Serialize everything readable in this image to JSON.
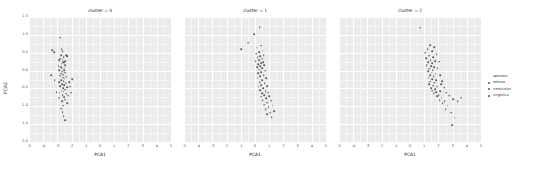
{
  "chart_data": {
    "type": "scatter",
    "title": "",
    "xlabel": "PCA1",
    "ylabel": "PCA2",
    "xlim": [
      -5,
      5
    ],
    "ylim": [
      -2.0,
      1.5
    ],
    "xticks": [
      "-5",
      "-4",
      "-3",
      "-2",
      "-1",
      "0",
      "1",
      "2",
      "3",
      "4",
      "5"
    ],
    "yticks": [
      "1.5",
      "1.0",
      "0.5",
      "0.0",
      "-0.5",
      "-1.0",
      "-1.5",
      "-2.0"
    ],
    "grid": true,
    "facet_by": "cluster",
    "legend": {
      "title": "species",
      "position": "right",
      "entries": [
        "setosa",
        "versicolor",
        "virginica"
      ]
    },
    "facets": [
      {
        "label": "cluster = 0",
        "points": [
          [
            -2.79,
            0.92
          ],
          [
            -2.7,
            0.6
          ],
          [
            -3.22,
            0.51
          ],
          [
            -2.64,
            0.55
          ],
          [
            -2.38,
            0.44
          ],
          [
            -2.72,
            0.44
          ],
          [
            -2.56,
            0.38
          ],
          [
            -2.8,
            0.33
          ],
          [
            -2.64,
            0.31
          ],
          [
            -2.89,
            0.29
          ],
          [
            -2.43,
            0.27
          ],
          [
            -2.6,
            0.24
          ],
          [
            -2.52,
            0.22
          ],
          [
            -2.71,
            0.19
          ],
          [
            -2.47,
            0.16
          ],
          [
            -3.39,
            0.57
          ],
          [
            -2.3,
            0.4
          ],
          [
            -2.91,
            0.13
          ],
          [
            -2.75,
            0.1
          ],
          [
            -2.5,
            0.08
          ],
          [
            -2.63,
            0.05
          ],
          [
            -2.86,
            0.02
          ],
          [
            -2.54,
            0.01
          ],
          [
            -2.68,
            -0.03
          ],
          [
            -2.44,
            -0.06
          ],
          [
            -2.75,
            -0.09
          ],
          [
            -2.58,
            -0.11
          ],
          [
            -2.82,
            -0.14
          ],
          [
            -2.36,
            -0.17
          ],
          [
            -2.61,
            -0.2
          ],
          [
            -2.49,
            -0.23
          ],
          [
            -2.73,
            -0.26
          ],
          [
            -2.55,
            -0.29
          ],
          [
            -2.88,
            -0.32
          ],
          [
            -2.41,
            -0.35
          ],
          [
            -2.66,
            -0.38
          ],
          [
            -2.52,
            -0.41
          ],
          [
            -2.79,
            -0.44
          ],
          [
            -2.33,
            -0.47
          ],
          [
            -2.59,
            -0.5
          ],
          [
            -2.47,
            -0.53
          ],
          [
            -2.7,
            -0.56
          ],
          [
            -2.56,
            -0.59
          ],
          [
            -2.84,
            -0.62
          ],
          [
            -2.39,
            -0.65
          ],
          [
            -2.63,
            -0.69
          ],
          [
            -2.51,
            -0.74
          ],
          [
            -2.45,
            -0.81
          ],
          [
            -2.68,
            -0.86
          ],
          [
            -2.3,
            -0.91
          ],
          [
            -2.59,
            -0.98
          ],
          [
            -2.74,
            -1.07
          ],
          [
            -2.62,
            -1.16
          ],
          [
            -2.55,
            -1.28
          ],
          [
            -2.46,
            -1.39
          ],
          [
            -3.2,
            -0.26
          ],
          [
            -3.05,
            -0.6
          ],
          [
            -2.18,
            -0.33
          ],
          [
            -2.22,
            -0.7
          ],
          [
            -2.1,
            -0.45
          ],
          [
            -1.95,
            -0.24
          ],
          [
            -2.05,
            -0.62
          ],
          [
            -2.88,
            -0.76
          ],
          [
            -3.42,
            -0.13
          ]
        ]
      },
      {
        "label": "cluster = 1",
        "points": [
          [
            0.33,
            1.22
          ],
          [
            -0.05,
            1.02
          ],
          [
            -0.46,
            0.78
          ],
          [
            0.43,
            0.7
          ],
          [
            0.12,
            0.64
          ],
          [
            -0.98,
            0.6
          ],
          [
            0.55,
            0.56
          ],
          [
            0.27,
            0.51
          ],
          [
            0.08,
            0.47
          ],
          [
            0.62,
            0.44
          ],
          [
            0.38,
            0.4
          ],
          [
            0.19,
            0.37
          ],
          [
            0.48,
            0.33
          ],
          [
            0.3,
            0.3
          ],
          [
            0.05,
            0.27
          ],
          [
            0.58,
            0.24
          ],
          [
            0.41,
            0.21
          ],
          [
            0.22,
            0.18
          ],
          [
            0.66,
            0.15
          ],
          [
            0.35,
            0.12
          ],
          [
            0.14,
            0.09
          ],
          [
            0.52,
            0.06
          ],
          [
            0.28,
            0.03
          ],
          [
            0.72,
            0.0
          ],
          [
            0.45,
            -0.04
          ],
          [
            0.24,
            -0.08
          ],
          [
            0.6,
            -0.12
          ],
          [
            0.38,
            -0.16
          ],
          [
            0.18,
            -0.2
          ],
          [
            0.8,
            -0.22
          ],
          [
            0.5,
            -0.27
          ],
          [
            0.33,
            -0.32
          ],
          [
            0.68,
            -0.36
          ],
          [
            0.44,
            -0.41
          ],
          [
            0.26,
            -0.45
          ],
          [
            0.86,
            -0.44
          ],
          [
            0.57,
            -0.5
          ],
          [
            0.37,
            -0.55
          ],
          [
            0.74,
            -0.58
          ],
          [
            0.49,
            -0.63
          ],
          [
            0.92,
            -0.62
          ],
          [
            0.64,
            -0.68
          ],
          [
            0.42,
            -0.73
          ],
          [
            1.02,
            -0.72
          ],
          [
            0.78,
            -0.78
          ],
          [
            0.55,
            -0.83
          ],
          [
            1.12,
            -0.84
          ],
          [
            0.88,
            -0.9
          ],
          [
            0.66,
            -0.95
          ],
          [
            1.24,
            -0.98
          ],
          [
            0.97,
            -1.02
          ],
          [
            0.74,
            -1.08
          ],
          [
            1.35,
            -1.13
          ],
          [
            1.08,
            -1.18
          ],
          [
            0.85,
            -1.22
          ],
          [
            1.18,
            -1.3
          ]
        ]
      },
      {
        "label": "cluster = 2",
        "points": [
          [
            0.72,
            1.2
          ],
          [
            1.4,
            0.72
          ],
          [
            1.72,
            0.66
          ],
          [
            1.25,
            0.6
          ],
          [
            1.55,
            0.55
          ],
          [
            1.08,
            0.5
          ],
          [
            1.88,
            0.46
          ],
          [
            1.36,
            0.42
          ],
          [
            1.62,
            0.38
          ],
          [
            1.14,
            0.34
          ],
          [
            1.45,
            0.3
          ],
          [
            1.78,
            0.27
          ],
          [
            1.28,
            0.24
          ],
          [
            1.56,
            0.2
          ],
          [
            2.05,
            0.25
          ],
          [
            1.18,
            0.16
          ],
          [
            1.48,
            0.12
          ],
          [
            1.72,
            0.09
          ],
          [
            1.33,
            0.05
          ],
          [
            1.6,
            0.02
          ],
          [
            1.95,
            0.06
          ],
          [
            1.26,
            -0.02
          ],
          [
            1.52,
            -0.06
          ],
          [
            1.8,
            -0.09
          ],
          [
            1.4,
            -0.13
          ],
          [
            1.66,
            -0.16
          ],
          [
            2.12,
            -0.12
          ],
          [
            1.32,
            -0.2
          ],
          [
            1.58,
            -0.24
          ],
          [
            1.85,
            -0.27
          ],
          [
            1.44,
            -0.31
          ],
          [
            1.7,
            -0.34
          ],
          [
            2.25,
            -0.3
          ],
          [
            1.36,
            -0.38
          ],
          [
            1.62,
            -0.42
          ],
          [
            1.92,
            -0.45
          ],
          [
            1.5,
            -0.49
          ],
          [
            1.76,
            -0.52
          ],
          [
            2.4,
            -0.48
          ],
          [
            1.58,
            -0.56
          ],
          [
            1.84,
            -0.6
          ],
          [
            2.1,
            -0.57
          ],
          [
            1.66,
            -0.64
          ],
          [
            2.02,
            -0.68
          ],
          [
            2.55,
            -0.62
          ],
          [
            1.9,
            -0.72
          ],
          [
            2.22,
            -0.76
          ],
          [
            2.78,
            -0.7
          ],
          [
            2.08,
            -0.82
          ],
          [
            2.45,
            -0.86
          ],
          [
            3.02,
            -0.8
          ],
          [
            2.3,
            -0.92
          ],
          [
            2.66,
            -0.98
          ],
          [
            3.35,
            -0.86
          ],
          [
            2.52,
            -1.08
          ],
          [
            2.88,
            -1.18
          ],
          [
            3.15,
            -1.32
          ],
          [
            2.95,
            -1.52
          ],
          [
            3.6,
            -0.76
          ],
          [
            2.18,
            -0.38
          ]
        ]
      }
    ]
  }
}
